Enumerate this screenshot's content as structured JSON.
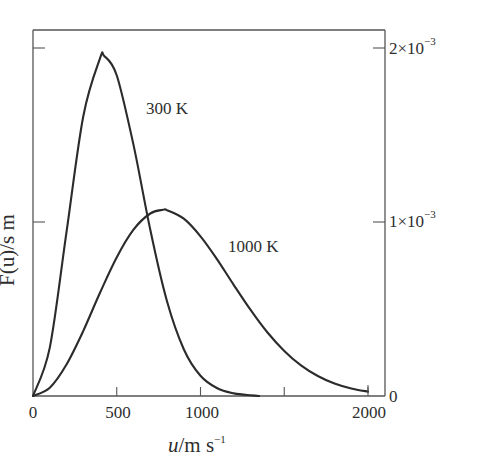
{
  "chart_data": {
    "type": "line",
    "title": "",
    "xlabel": "u/m s^-1",
    "xlabel_parts": {
      "var": "u",
      "unit": "/m s",
      "exp": "−1"
    },
    "ylabel": "F(u)/s m^-1",
    "ylabel_visible": "F(u)/s m",
    "xlim": [
      0,
      2000
    ],
    "ylim": [
      0,
      0.0021
    ],
    "x_ticks": [
      0,
      500,
      1000,
      1500,
      2000
    ],
    "x_tick_labels": [
      "0",
      "500",
      "1000",
      "",
      "2000"
    ],
    "y_ticks": [
      0,
      0.001,
      0.002
    ],
    "y_tick_labels": [
      {
        "mant": "0",
        "exp": ""
      },
      {
        "mant": "1×10",
        "exp": "−3"
      },
      {
        "mant": "2×10",
        "exp": "−3"
      }
    ],
    "y_axis_position": "right labels",
    "grid": false,
    "legend": "inline labels",
    "series": [
      {
        "name": "300 K",
        "x": [
          0,
          100,
          200,
          300,
          400,
          425,
          500,
          600,
          700,
          800,
          900,
          1000,
          1100,
          1200,
          1300,
          1350
        ],
        "y": [
          0,
          0.000278,
          0.000942,
          0.001608,
          0.00194,
          0.001954,
          0.001842,
          0.001443,
          0.000955,
          0.000544,
          0.000269,
          0.000116,
          4.4e-05,
          1.5e-05,
          4e-06,
          0
        ]
      },
      {
        "name": "1000 K",
        "x": [
          0,
          100,
          200,
          300,
          400,
          500,
          600,
          700,
          776,
          800,
          900,
          1000,
          1100,
          1200,
          1300,
          1400,
          1500,
          1600,
          1700,
          1800,
          1900,
          2000
        ],
        "y": [
          0,
          4.75e-05,
          0.000181,
          0.000374,
          0.000593,
          0.000797,
          0.000956,
          0.001049,
          0.00107,
          0.001068,
          0.001019,
          0.000918,
          0.000784,
          0.000636,
          0.000493,
          0.000365,
          0.000259,
          0.000176,
          0.000115,
          7.2e-05,
          4.3e-05,
          2.5e-05
        ]
      }
    ],
    "annotations": [
      {
        "text": "300 K",
        "near_series": "300 K"
      },
      {
        "text": "1000 K",
        "near_series": "1000 K"
      }
    ]
  },
  "labels": {
    "curve_300": "300 K",
    "curve_1000": "1000 K",
    "x_title_var": "u",
    "x_title_unit": "/m s",
    "x_title_exp": "−1",
    "y_title": "F(u)/s m",
    "x_tick_0": "0",
    "x_tick_500": "500",
    "x_tick_1000": "1000",
    "x_tick_2000": "2000",
    "y_tick_0": "0",
    "y_tick_1_mant": "1×10",
    "y_tick_1_exp": "−3",
    "y_tick_2_mant": "2×10",
    "y_tick_2_exp": "−3"
  }
}
